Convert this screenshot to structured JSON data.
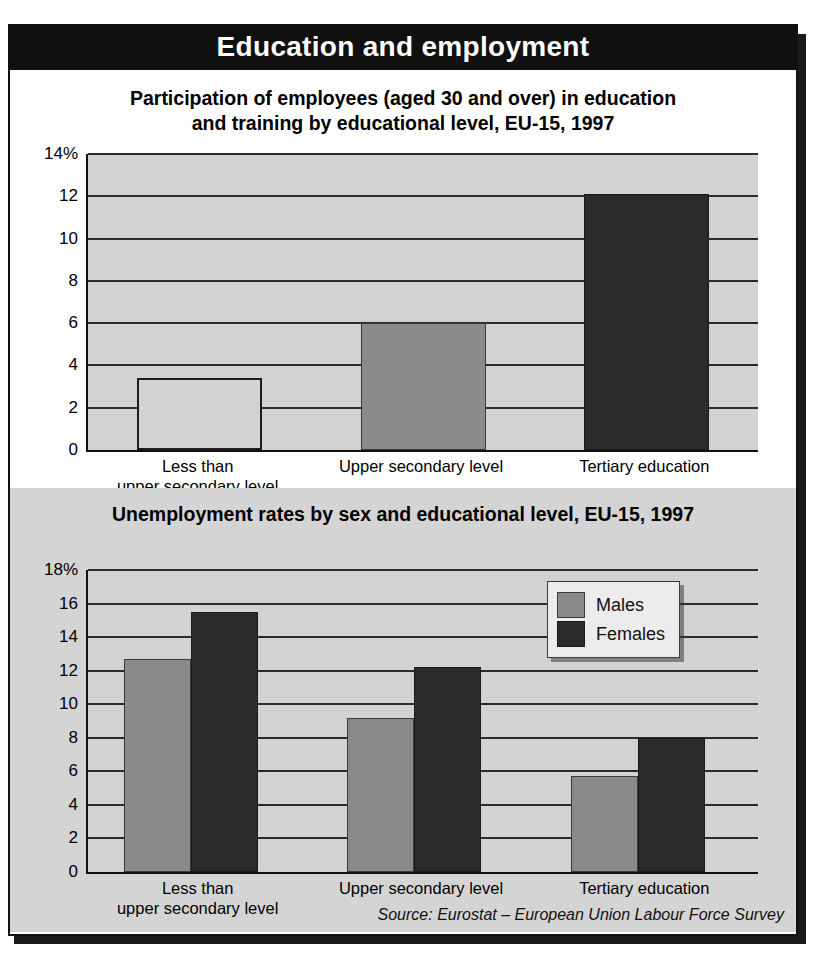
{
  "banner": {
    "title": "Education and employment"
  },
  "source": {
    "text": "Source: Eurostat – European Union Labour Force Survey"
  },
  "chart1": {
    "title_line1": "Participation of employees (aged 30 and over) in education",
    "title_line2": "and training by educational level, EU-15, 1997",
    "ytick_labels": [
      "14%",
      "12",
      "10",
      "8",
      "6",
      "4",
      "2",
      "0"
    ],
    "categories_line1": [
      "Less than",
      "Upper secondary level",
      "Tertiary education"
    ],
    "categories_line2": [
      "upper secondary level",
      "",
      ""
    ]
  },
  "chart2": {
    "title": "Unemployment rates by sex and educational level, EU-15, 1997",
    "ytick_labels": [
      "18%",
      "16",
      "14",
      "12",
      "10",
      "8",
      "6",
      "4",
      "2",
      "0"
    ],
    "legend": [
      {
        "label": "Males",
        "swatch": "mid"
      },
      {
        "label": "Females",
        "swatch": "dark"
      }
    ],
    "categories_line1": [
      "Less than",
      "Upper secondary level",
      "Tertiary education"
    ],
    "categories_line2": [
      "upper secondary level",
      "",
      ""
    ]
  },
  "chart_data": [
    {
      "type": "bar",
      "title": "Participation of employees (aged 30 and over) in education and training by educational level, EU-15, 1997",
      "xlabel": "",
      "ylabel": "%",
      "categories": [
        "Less than upper secondary level",
        "Upper secondary level",
        "Tertiary education"
      ],
      "values": [
        3.4,
        6.0,
        12.1
      ],
      "ylim": [
        0,
        14
      ],
      "yticks": [
        0,
        2,
        4,
        6,
        8,
        10,
        12,
        14
      ],
      "ytick_labels": [
        "0",
        "2",
        "4",
        "6",
        "8",
        "10",
        "12",
        "14%"
      ],
      "grid": true,
      "legend": "none",
      "bar_fills": [
        "light",
        "mid",
        "dark"
      ]
    },
    {
      "type": "bar",
      "title": "Unemployment rates by sex and educational level, EU-15, 1997",
      "xlabel": "",
      "ylabel": "%",
      "categories": [
        "Less than upper secondary level",
        "Upper secondary level",
        "Tertiary education"
      ],
      "series": [
        {
          "name": "Males",
          "values": [
            12.7,
            9.2,
            5.7
          ]
        },
        {
          "name": "Females",
          "values": [
            15.5,
            12.2,
            8.0
          ]
        }
      ],
      "ylim": [
        0,
        18
      ],
      "yticks": [
        0,
        2,
        4,
        6,
        8,
        10,
        12,
        14,
        16,
        18
      ],
      "ytick_labels": [
        "0",
        "2",
        "4",
        "6",
        "8",
        "10",
        "12",
        "14",
        "16",
        "18%"
      ],
      "grid": true,
      "legend": "top-right"
    }
  ]
}
